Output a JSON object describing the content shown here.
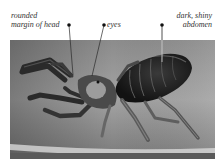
{
  "figure": {
    "annotations": [
      {
        "id": "head",
        "text": "rounded\nmargin of head",
        "dot": [
          69,
          25
        ],
        "line_end": [
          73,
          75
        ]
      },
      {
        "id": "eyes",
        "text": "eyes",
        "dot": [
          104,
          25
        ],
        "line_end": [
          92,
          76
        ]
      },
      {
        "id": "abdomen",
        "text": "dark, shiny\nabdomen",
        "dot": [
          162,
          25
        ],
        "line_end": [
          162,
          62
        ]
      }
    ]
  },
  "colors": {
    "background": "#ffffff",
    "photo_bg": "#9a9a9a",
    "spider_body": "#1e1e1e",
    "leader_line": "#333333"
  }
}
